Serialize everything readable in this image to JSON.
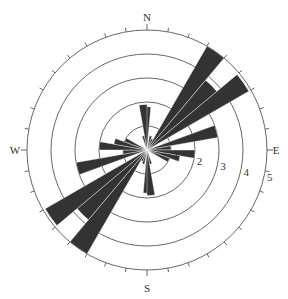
{
  "diagram": {
    "type": "rose",
    "center": [
      147,
      150
    ],
    "unit_px": 24,
    "max_radius": 5,
    "fill_color": "#333333",
    "ring_color": "#555555",
    "cardinals": {
      "north": "N",
      "south": "S",
      "east": "E",
      "west": "W"
    },
    "ring_labels": [
      "1",
      "2",
      "3",
      "4",
      "5"
    ],
    "tick_step_deg": 10
  },
  "chart_data": {
    "type": "rose",
    "title": "",
    "bin_width_deg": 10,
    "symmetric": true,
    "radial_axis": {
      "ticks": [
        1,
        2,
        3,
        4,
        5
      ],
      "range": [
        0,
        5
      ]
    },
    "direction_labels": [
      "N",
      "E",
      "S",
      "W"
    ],
    "bins": [
      {
        "from": -5,
        "to": 5,
        "value": 1.8
      },
      {
        "from": 10,
        "to": 20,
        "value": 0.6
      },
      {
        "from": 20,
        "to": 30,
        "value": 0.5
      },
      {
        "from": 30,
        "to": 40,
        "value": 5.0
      },
      {
        "from": 40,
        "to": 50,
        "value": 3.8
      },
      {
        "from": 50,
        "to": 60,
        "value": 4.9
      },
      {
        "from": 70,
        "to": 80,
        "value": 3.0
      },
      {
        "from": 80,
        "to": 90,
        "value": 1.0
      },
      {
        "from": 90,
        "to": 100,
        "value": 2.0
      },
      {
        "from": 100,
        "to": 110,
        "value": 1.4
      },
      {
        "from": 110,
        "to": 120,
        "value": 1.0
      },
      {
        "from": 160,
        "to": 170,
        "value": 0.6
      },
      {
        "from": 170,
        "to": 180,
        "value": 1.9
      }
    ]
  }
}
